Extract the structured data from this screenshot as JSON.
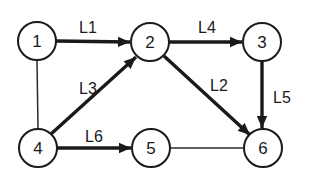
{
  "diagram": {
    "background_color": "#ffffff",
    "stroke_color": "#1a1a1a",
    "thin_stroke_color": "#2b2b2b",
    "nodes": [
      {
        "id": "n1",
        "label": "1",
        "cx": 37,
        "cy": 41,
        "r": 19
      },
      {
        "id": "n2",
        "label": "2",
        "cx": 150,
        "cy": 42,
        "r": 19
      },
      {
        "id": "n3",
        "label": "3",
        "cx": 262,
        "cy": 42,
        "r": 19
      },
      {
        "id": "n4",
        "label": "4",
        "cx": 38,
        "cy": 148,
        "r": 19
      },
      {
        "id": "n5",
        "label": "5",
        "cx": 151,
        "cy": 148,
        "r": 19
      },
      {
        "id": "n6",
        "label": "6",
        "cx": 263,
        "cy": 148,
        "r": 19
      }
    ],
    "edges": [
      {
        "id": "e-l1",
        "label": "L1",
        "from": "1",
        "to": "2",
        "style": "thick",
        "arrow": true,
        "x1": 56,
        "y1": 41,
        "x2": 130,
        "y2": 42,
        "label_x": 88,
        "label_y": 27
      },
      {
        "id": "e-l4",
        "label": "L4",
        "from": "2",
        "to": "3",
        "style": "thick",
        "arrow": true,
        "x1": 169,
        "y1": 42,
        "x2": 242,
        "y2": 42,
        "label_x": 207,
        "label_y": 27
      },
      {
        "id": "e-l3",
        "label": "L3",
        "from": "4",
        "to": "2",
        "style": "thick",
        "arrow": true,
        "x1": 51,
        "y1": 134,
        "x2": 136,
        "y2": 57,
        "label_x": 88,
        "label_y": 88
      },
      {
        "id": "e-l2",
        "label": "L2",
        "from": "2",
        "to": "6",
        "style": "thick",
        "arrow": true,
        "x1": 164,
        "y1": 56,
        "x2": 250,
        "y2": 135,
        "label_x": 219,
        "label_y": 85
      },
      {
        "id": "e-l5",
        "label": "L5",
        "from": "3",
        "to": "6",
        "style": "thick",
        "arrow": true,
        "x1": 262,
        "y1": 61,
        "x2": 262,
        "y2": 128,
        "label_x": 282,
        "label_y": 97
      },
      {
        "id": "e-l6",
        "label": "L6",
        "from": "4",
        "to": "5",
        "style": "thick",
        "arrow": true,
        "x1": 57,
        "y1": 148,
        "x2": 131,
        "y2": 148,
        "label_x": 94,
        "label_y": 136
      },
      {
        "id": "e-14",
        "label": "",
        "from": "1",
        "to": "4",
        "style": "thin",
        "arrow": false,
        "x1": 37,
        "y1": 60,
        "x2": 38,
        "y2": 129,
        "label_x": 0,
        "label_y": 0
      },
      {
        "id": "e-56",
        "label": "",
        "from": "5",
        "to": "6",
        "style": "thin",
        "arrow": false,
        "x1": 170,
        "y1": 148,
        "x2": 244,
        "y2": 148,
        "label_x": 0,
        "label_y": 0
      }
    ]
  }
}
